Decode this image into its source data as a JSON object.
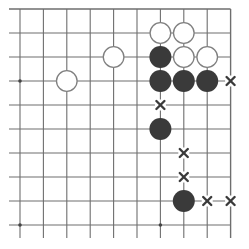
{
  "diagram": {
    "type": "go-board-fragment",
    "corner": "top-right",
    "columns": 10,
    "rows": 10,
    "origin_x": 20,
    "origin_y": 9,
    "spacing_x": 23.4,
    "spacing_y": 24,
    "colors": {
      "line": "#6e6e6e",
      "black_stone": "#3a3a3a",
      "white_stone_fill": "#ffffff",
      "white_stone_stroke": "#808080",
      "mark": "#3a3a3a",
      "star_point": "#444444"
    },
    "star_points": [
      {
        "col": 0,
        "row": 3
      },
      {
        "col": 0,
        "row": 9
      },
      {
        "col": 6,
        "row": 9
      }
    ],
    "stones": [
      {
        "color": "white",
        "col": 6,
        "row": 1
      },
      {
        "color": "white",
        "col": 7,
        "row": 1
      },
      {
        "color": "black",
        "col": 6,
        "row": 2
      },
      {
        "color": "white",
        "col": 7,
        "row": 2
      },
      {
        "color": "white",
        "col": 8,
        "row": 2
      },
      {
        "color": "white",
        "col": 4,
        "row": 2
      },
      {
        "color": "white",
        "col": 2,
        "row": 3
      },
      {
        "color": "black",
        "col": 6,
        "row": 3
      },
      {
        "color": "black",
        "col": 7,
        "row": 3
      },
      {
        "color": "black",
        "col": 8,
        "row": 3
      },
      {
        "color": "black",
        "col": 6,
        "row": 5
      },
      {
        "color": "black",
        "col": 7,
        "row": 8
      }
    ],
    "marks": [
      {
        "symbol": "x",
        "col": 9,
        "row": 3
      },
      {
        "symbol": "x",
        "col": 6,
        "row": 4
      },
      {
        "symbol": "x",
        "col": 7,
        "row": 6
      },
      {
        "symbol": "x",
        "col": 7,
        "row": 7
      },
      {
        "symbol": "x",
        "col": 8,
        "row": 8
      },
      {
        "symbol": "x",
        "col": 9,
        "row": 8
      }
    ]
  }
}
